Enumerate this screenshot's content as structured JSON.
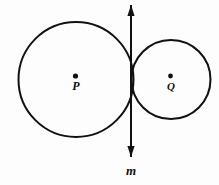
{
  "figure": {
    "background_color": "#fdfdfd",
    "stroke_color": "#111111",
    "width": 219,
    "height": 185
  },
  "circles": [
    {
      "id": "circle-p",
      "label": "P",
      "center_label": "P",
      "cx": 76,
      "cy": 79.5,
      "r": 57.5,
      "stroke_width": 2.0,
      "label_x": 76,
      "label_y": 90,
      "label_font_size": 12,
      "dot_x": 75.5,
      "dot_y": 76,
      "dot_r": 2.6
    },
    {
      "id": "circle-q",
      "label": "Q",
      "center_label": "Q",
      "cx": 171,
      "cy": 79.5,
      "r": 39.5,
      "stroke_width": 2.0,
      "label_x": 171,
      "label_y": 90,
      "label_font_size": 11,
      "dot_x": 170.5,
      "dot_y": 76,
      "dot_r": 2.4
    }
  ],
  "tangent_line": {
    "id": "line-m",
    "label": "m",
    "x": 131,
    "y_top": 5,
    "y_bottom": 157,
    "stroke_width": 2.0,
    "arrow_half_width": 3.6,
    "arrow_length": 11,
    "label_x": 131,
    "label_y": 175,
    "label_font_size": 13
  },
  "tangent_point": {
    "x": 131,
    "y": 79.5
  }
}
